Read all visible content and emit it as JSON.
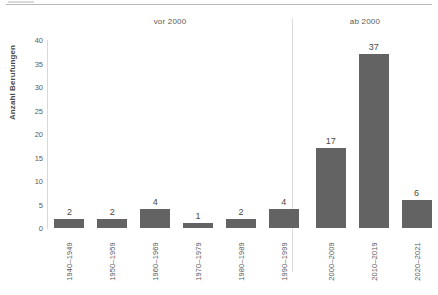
{
  "chart_data": {
    "type": "bar",
    "title": "",
    "xlabel": "",
    "ylabel": "Anzahl Berufungen",
    "categories": [
      "1940–1949",
      "1950–1959",
      "1960–1969",
      "1970–1979",
      "1980–1989",
      "1990–1999",
      "2000–2009",
      "2010–2019",
      "2020–2021"
    ],
    "values": [
      2,
      2,
      4,
      1,
      2,
      4,
      17,
      37,
      6
    ],
    "data_labels": [
      "2",
      "2",
      "4",
      "1",
      "2",
      "4",
      "17",
      "37",
      "6"
    ],
    "ylim": [
      0,
      40
    ],
    "y_ticks": [
      0,
      5,
      10,
      15,
      20,
      25,
      30,
      35,
      40
    ],
    "y_tick_labels": [
      "0",
      "5",
      "10",
      "15",
      "20",
      "25",
      "30",
      "35",
      "40"
    ],
    "grid": false,
    "legend": "none",
    "bar_color": "#636363",
    "groups": [
      {
        "label": "vor 2000",
        "categories": [
          "1940–1949",
          "1950–1959",
          "1960–1969",
          "1970–1979",
          "1980–1989",
          "1990–1999"
        ]
      },
      {
        "label": "ab 2000",
        "categories": [
          "2000–2009",
          "2010–2019",
          "2020–2021"
        ]
      }
    ]
  },
  "axis": {
    "y_title": "Anzahl Berufungen"
  },
  "groups": {
    "left_label": "vor 2000",
    "right_label": "ab 2000"
  }
}
